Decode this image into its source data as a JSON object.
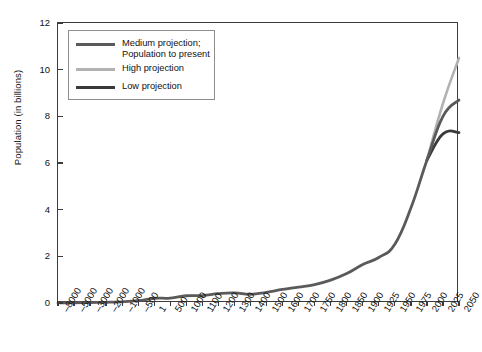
{
  "chart_data": {
    "type": "line",
    "title": "",
    "xlabel": "",
    "ylabel": "Population (in billions)",
    "ylim": [
      0,
      12
    ],
    "yticks": [
      0,
      2,
      4,
      6,
      8,
      10,
      12
    ],
    "ytick_labels": [
      "0",
      "2",
      "4",
      "6",
      "8",
      "10",
      "12"
    ],
    "grid": false,
    "legend_position": "upper-left-inside",
    "x_categories": [
      "-8000",
      "-5000",
      "-3000",
      "-2000",
      "-1000",
      "-500",
      "1",
      "500",
      "1000",
      "1100",
      "1200",
      "1300",
      "1400",
      "1500",
      "1600",
      "1700",
      "1750",
      "1800",
      "1850",
      "1900",
      "1925",
      "1950",
      "1975",
      "2000",
      "2025",
      "2050"
    ],
    "series": [
      {
        "name": "Medium projection;\nPopulation to present",
        "color": "#5a5a5a",
        "values": [
          0.005,
          0.01,
          0.02,
          0.03,
          0.05,
          0.1,
          0.2,
          0.21,
          0.31,
          0.32,
          0.4,
          0.43,
          0.37,
          0.46,
          0.58,
          0.68,
          0.79,
          0.98,
          1.26,
          1.65,
          1.95,
          2.52,
          4.07,
          6.12,
          8.0,
          8.7
        ]
      },
      {
        "name": "High projection",
        "color": "#b2b2b2",
        "values": [
          null,
          null,
          null,
          null,
          null,
          null,
          null,
          null,
          null,
          null,
          null,
          null,
          null,
          null,
          null,
          null,
          null,
          null,
          null,
          null,
          null,
          null,
          null,
          6.12,
          8.55,
          10.5
        ]
      },
      {
        "name": "Low projection",
        "color": "#3a3a3a",
        "values": [
          null,
          null,
          null,
          null,
          null,
          null,
          null,
          null,
          null,
          null,
          null,
          null,
          null,
          null,
          null,
          null,
          null,
          null,
          null,
          null,
          null,
          null,
          null,
          6.12,
          7.25,
          7.3
        ]
      }
    ],
    "legend_entries": [
      {
        "label": "Medium projection;\nPopulation to present",
        "color": "#5a5a5a"
      },
      {
        "label": "High projection",
        "color": "#b2b2b2"
      },
      {
        "label": "Low projection",
        "color": "#3a3a3a"
      }
    ]
  }
}
